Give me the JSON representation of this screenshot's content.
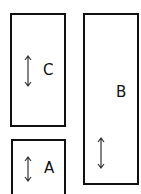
{
  "boxes": [
    {
      "id": "C",
      "label": "C"
    },
    {
      "id": "B",
      "label": "B"
    },
    {
      "id": "A",
      "label": "A"
    }
  ],
  "icons": {
    "arrow": "vertical-double-arrow"
  }
}
